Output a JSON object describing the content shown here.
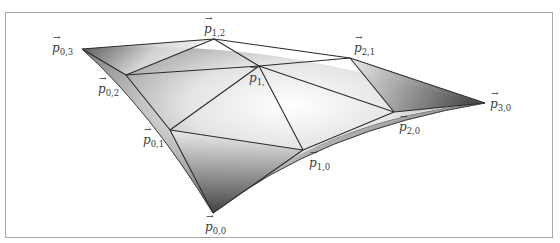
{
  "figure": {
    "type": "bezier-triangle-patch",
    "frame_color": "#a8a8a8",
    "line_color": "#2b2b2b",
    "shade_dark": "#3c3c3c",
    "shade_light": "#ffffff",
    "control_points": [
      {
        "id": "p00",
        "symbol": "p",
        "subscript": "0,0",
        "x": 213,
        "y": 213
      },
      {
        "id": "p10",
        "symbol": "p",
        "subscript": "1,0",
        "x": 303,
        "y": 150
      },
      {
        "id": "p20",
        "symbol": "p",
        "subscript": "2,0",
        "x": 394,
        "y": 112
      },
      {
        "id": "p30",
        "symbol": "p",
        "subscript": "3,0",
        "x": 485,
        "y": 103
      },
      {
        "id": "p01",
        "symbol": "p",
        "subscript": "0,1",
        "x": 170,
        "y": 130
      },
      {
        "id": "p11",
        "symbol": "p",
        "subscript": "1,1",
        "x": 259,
        "y": 66
      },
      {
        "id": "p21",
        "symbol": "p",
        "subscript": "2,1",
        "x": 350,
        "y": 58
      },
      {
        "id": "p02",
        "symbol": "p",
        "subscript": "0,2",
        "x": 126,
        "y": 75
      },
      {
        "id": "p12",
        "symbol": "p",
        "subscript": "1,2",
        "x": 214,
        "y": 39
      },
      {
        "id": "p03",
        "symbol": "p",
        "subscript": "0,3",
        "x": 82,
        "y": 49
      }
    ]
  },
  "labels": {
    "p00": {
      "base": "p",
      "sub": "0,0"
    },
    "p10": {
      "base": "p",
      "sub": "1,0"
    },
    "p20": {
      "base": "p",
      "sub": "2,0"
    },
    "p30": {
      "base": "p",
      "sub": "3,0"
    },
    "p01": {
      "base": "p",
      "sub": "0,1"
    },
    "p11": {
      "base": "p",
      "sub": "1,"
    },
    "p21": {
      "base": "p",
      "sub": "2,1"
    },
    "p02": {
      "base": "p",
      "sub": "0,2"
    },
    "p12": {
      "base": "p",
      "sub": "1,2"
    },
    "p03": {
      "base": "p",
      "sub": "0,3"
    }
  }
}
